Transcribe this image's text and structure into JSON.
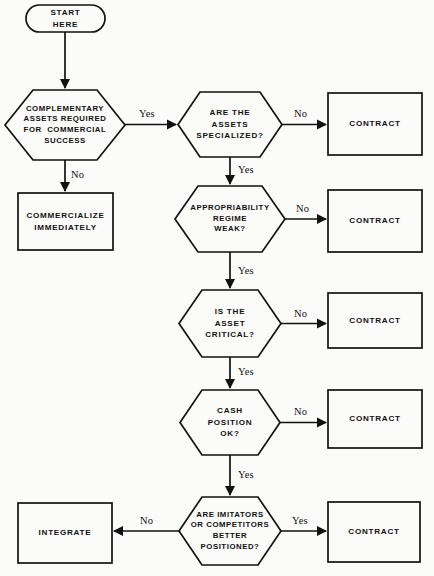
{
  "diagram": {
    "background_color": "#fbfbfa",
    "stroke_color": "#111111",
    "nodes": {
      "start": {
        "label": "START\nHERE",
        "shape": "stadium"
      },
      "complementary_assets": {
        "label": "COMPLEMENTARY\nASSETS REQUIRED\nFOR  COMMERCIAL\nSUCCESS",
        "shape": "hexagon"
      },
      "commercialize": {
        "label": "COMMERCIALIZE\nIMMEDIATELY",
        "shape": "rectangle"
      },
      "assets_specialized": {
        "label": "ARE THE\nASSETS\nSPECIALIZED?",
        "shape": "hexagon"
      },
      "appropriability": {
        "label": "APPROPRIABILITY\nREGIME\nWEAK?",
        "shape": "hexagon"
      },
      "asset_critical": {
        "label": "IS THE\nASSET\nCRITICAL?",
        "shape": "hexagon"
      },
      "cash_position": {
        "label": "CASH\nPOSITION\nOK?",
        "shape": "hexagon"
      },
      "imitators": {
        "label": "ARE IMITATORS\nOR COMPETITORS\nBETTER\nPOSITIONED?",
        "shape": "hexagon"
      },
      "contract_1": {
        "label": "CONTRACT",
        "shape": "rectangle"
      },
      "contract_2": {
        "label": "CONTRACT",
        "shape": "rectangle"
      },
      "contract_3": {
        "label": "CONTRACT",
        "shape": "rectangle"
      },
      "contract_4": {
        "label": "CONTRACT",
        "shape": "rectangle"
      },
      "contract_5": {
        "label": "CONTRACT",
        "shape": "rectangle"
      },
      "integrate": {
        "label": "INTEGRATE",
        "shape": "rectangle"
      }
    },
    "edge_labels": {
      "complementary_yes": "Yes",
      "complementary_no": "No",
      "specialized_no": "No",
      "specialized_yes": "Yes",
      "appropriability_no": "No",
      "appropriability_yes": "Yes",
      "critical_no": "No",
      "critical_yes": "Yes",
      "cash_no": "No",
      "cash_yes": "Yes",
      "imitators_yes": "Yes",
      "imitators_no": "No"
    }
  }
}
